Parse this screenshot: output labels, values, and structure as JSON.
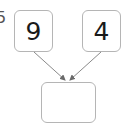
{
  "diagram": {
    "partial_label": "5",
    "left_box": {
      "value": "9"
    },
    "right_box": {
      "value": "4"
    },
    "result_box": {
      "value": ""
    },
    "colors": {
      "border": "#b5b5b5",
      "arrow": "#8a8a8a",
      "text": "#1a1a1a"
    }
  }
}
